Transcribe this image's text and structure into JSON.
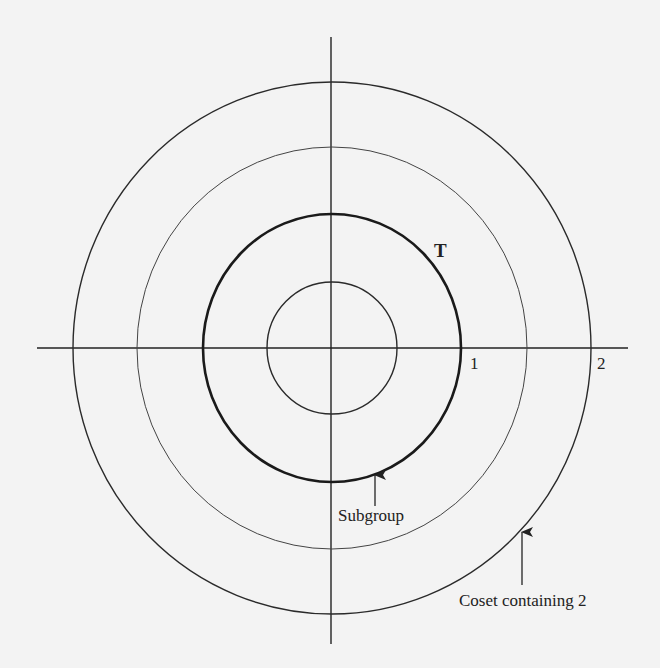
{
  "diagram": {
    "title": "",
    "colors": {
      "background": "#f3f3f3",
      "ink": "#222222"
    },
    "center": {
      "x": 332,
      "y": 348
    },
    "axes": {
      "horizontal": {
        "x1": 37,
        "x2": 628,
        "y": 348
      },
      "vertical": {
        "x": 331,
        "y1": 37,
        "y2": 644
      }
    },
    "circles": [
      {
        "name": "inner-circle",
        "rx": 65,
        "ry": 66,
        "stroke_width": 1.4
      },
      {
        "name": "unit-circle-T",
        "rx": 129,
        "ry": 134,
        "stroke_width": 2.6
      },
      {
        "name": "middle-circle",
        "rx": 195,
        "ry": 201,
        "stroke_width": 1.0
      },
      {
        "name": "coset-circle",
        "rx": 259,
        "ry": 266,
        "stroke_width": 1.4
      }
    ],
    "labels": {
      "circle_T": "T",
      "tick_1": "1",
      "tick_2": "2",
      "subgroup": "Subgroup",
      "coset": "Coset containing 2"
    },
    "arrows": [
      {
        "name": "subgroup-arrow",
        "x": 375,
        "y_tip": 473,
        "y_tail": 506
      },
      {
        "name": "coset-arrow",
        "x": 522,
        "y_tip": 530,
        "y_tail": 585
      }
    ]
  }
}
